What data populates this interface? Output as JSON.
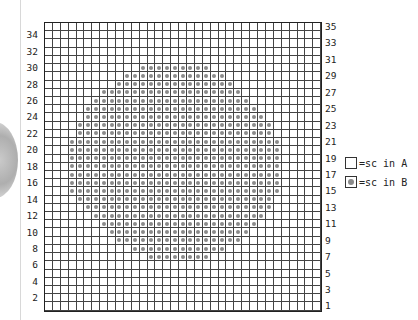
{
  "chart": {
    "columns": 35,
    "rows": 35,
    "left_row_labels": [
      "34",
      "32",
      "30",
      "28",
      "26",
      "24",
      "22",
      "20",
      "18",
      "16",
      "14",
      "12",
      "10",
      "8",
      "6",
      "4",
      "2"
    ],
    "right_row_labels": [
      "35",
      "33",
      "31",
      "29",
      "27",
      "25",
      "23",
      "21",
      "19",
      "17",
      "15",
      "13",
      "11",
      "9",
      "7",
      "5",
      "3",
      "1"
    ],
    "pattern_rows_color_b": {
      "30": [
        12,
        20
      ],
      "29": [
        10,
        22
      ],
      "28": [
        9,
        23
      ],
      "27": [
        7,
        24
      ],
      "26": [
        6,
        25
      ],
      "25": [
        5,
        26
      ],
      "24": [
        5,
        27
      ],
      "23": [
        4,
        28
      ],
      "22": [
        4,
        28
      ],
      "21": [
        3,
        29
      ],
      "20": [
        3,
        29
      ],
      "19": [
        3,
        29
      ],
      "18": [
        3,
        29
      ],
      "17": [
        3,
        29
      ],
      "16": [
        3,
        29
      ],
      "15": [
        3,
        29
      ],
      "14": [
        4,
        28
      ],
      "13": [
        5,
        28
      ],
      "12": [
        6,
        27
      ],
      "11": [
        7,
        26
      ],
      "10": [
        8,
        25
      ],
      "9": [
        9,
        24
      ],
      "8": [
        11,
        22
      ],
      "7": [
        13,
        20
      ]
    },
    "colors": {
      "grid_line": "#444444",
      "dot": "#8a8a8a",
      "background": "#ffffff"
    }
  },
  "legend": [
    {
      "symbol": "empty-square",
      "label": "=sc in A"
    },
    {
      "symbol": "dot-square",
      "label": "=sc in B"
    }
  ]
}
